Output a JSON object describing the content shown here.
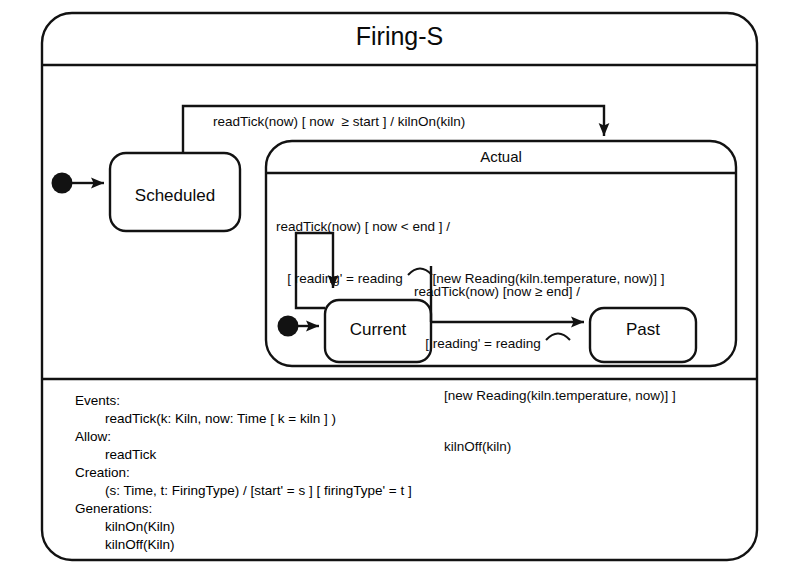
{
  "diagram": {
    "type": "uml-statechart",
    "title": "Firing-S",
    "stroke_color": "#121212",
    "background_color": "#ffffff"
  },
  "states": {
    "outer": {
      "name": "Firing-S",
      "title": "Firing-S"
    },
    "scheduled": {
      "name": "Scheduled",
      "title": "Scheduled"
    },
    "actual": {
      "name": "Actual",
      "title": "Actual"
    },
    "current": {
      "name": "Current",
      "title": "Current"
    },
    "past": {
      "name": "Past",
      "title": "Past"
    }
  },
  "transitions": {
    "start_to_actual": {
      "from": "Scheduled",
      "to": "Actual",
      "line1": "readTick(now) [ now  ≥ start ] / kilnOn(kiln)"
    },
    "current_self_loop": {
      "from": "Current",
      "to": "Current",
      "line1": "readTick(now) [ now < end ] /",
      "line2_pre": "   [ reading' = reading ",
      "line2_post": "[new Reading(kiln.temperature, now)] ]"
    },
    "current_to_past": {
      "from": "Current",
      "to": "Past",
      "line1": "readTick(now) [now ≥ end] /",
      "line2_pre": "   [ reading' = reading ",
      "line2_post": "",
      "line3": "        [new Reading(kiln.temperature, now)] ]",
      "line4": "        kilnOff(kiln)"
    }
  },
  "spec": {
    "events_label": "Events:",
    "events_items": [
      "readTick(k: Kiln, now: Time [ k = kiln ] )"
    ],
    "allow_label": "Allow:",
    "allow_items": [
      "readTick"
    ],
    "creation_label": "Creation:",
    "creation_items": [
      "(s: Time, t: FiringType) / [start' = s ] [ firingType' = t ]"
    ],
    "generations_label": "Generations:",
    "generations_items": [
      "kilnOn(Kiln)",
      "kilnOff(Kiln)"
    ]
  }
}
